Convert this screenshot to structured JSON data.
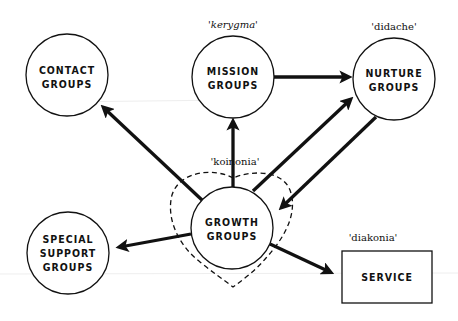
{
  "diagram": {
    "nodes": {
      "contact": {
        "line1": "CONTACT",
        "line2": "GROUPS"
      },
      "mission": {
        "line1": "MISSION",
        "line2": "GROUPS",
        "annotation": "'kerygma'"
      },
      "nurture": {
        "line1": "NURTURE",
        "line2": "GROUPS",
        "annotation": "'didache'"
      },
      "growth": {
        "line1": "GROWTH",
        "line2": "GROUPS",
        "annotation": "'koinonia'"
      },
      "special": {
        "line1": "SPECIAL",
        "line2": "SUPPORT",
        "line3": "GROUPS"
      },
      "service": {
        "line1": "SERVICE",
        "annotation": "'diakonia'"
      }
    },
    "edges": [
      {
        "from": "growth",
        "to": "contact"
      },
      {
        "from": "growth",
        "to": "mission"
      },
      {
        "from": "mission",
        "to": "nurture"
      },
      {
        "from": "growth",
        "to": "nurture"
      },
      {
        "from": "nurture",
        "to": "growth"
      },
      {
        "from": "growth",
        "to": "special"
      },
      {
        "from": "growth",
        "to": "service"
      }
    ],
    "colors": {
      "stroke": "#111111",
      "background": "#ffffff"
    }
  }
}
